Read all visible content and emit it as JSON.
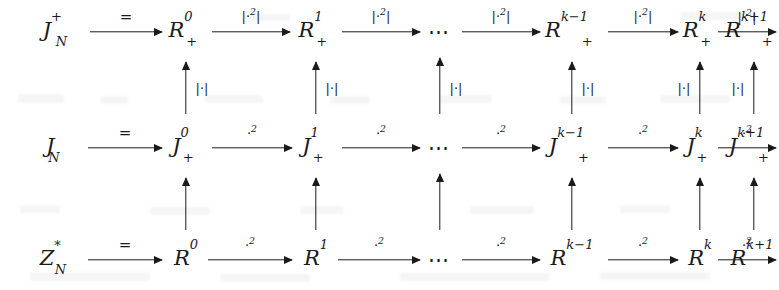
{
  "diagram": {
    "type": "commutative-diagram",
    "columns": [
      "source",
      "0",
      "1",
      "dots",
      "k-1",
      "k",
      "k+1"
    ],
    "rows": [
      {
        "id": "top",
        "nodes": [
          {
            "id": "top-source",
            "base": "J",
            "sub": "N",
            "sup": "+"
          },
          {
            "id": "top-0",
            "base": "R",
            "sub": "+",
            "sup": "0"
          },
          {
            "id": "top-1",
            "base": "R",
            "sub": "+",
            "sup": "1"
          },
          {
            "id": "top-dots",
            "base": "⋯"
          },
          {
            "id": "top-km1",
            "base": "R",
            "sub": "+",
            "sup": "k−1"
          },
          {
            "id": "top-k",
            "base": "R",
            "sub": "+",
            "sup": "k"
          },
          {
            "id": "top-kp1",
            "base": "R",
            "sub": "+",
            "sup": "k+1"
          }
        ],
        "arrow_labels": [
          "=",
          "|·²|",
          "|·²|",
          "|·²|",
          "|·²|",
          "|·²|"
        ]
      },
      {
        "id": "middle",
        "nodes": [
          {
            "id": "mid-source",
            "base": "J",
            "sub": "N",
            "sup": ""
          },
          {
            "id": "mid-0",
            "base": "J",
            "sub": "+",
            "sup": "0"
          },
          {
            "id": "mid-1",
            "base": "J",
            "sub": "+",
            "sup": "1"
          },
          {
            "id": "mid-dots",
            "base": "⋯"
          },
          {
            "id": "mid-km1",
            "base": "J",
            "sub": "+",
            "sup": "k−1"
          },
          {
            "id": "mid-k",
            "base": "J",
            "sub": "+",
            "sup": "k"
          },
          {
            "id": "mid-kp1",
            "base": "J",
            "sub": "+",
            "sup": "k+1"
          }
        ],
        "arrow_labels": [
          "=",
          "·²",
          "·²",
          "·²",
          "·²",
          "·²"
        ]
      },
      {
        "id": "bottom",
        "nodes": [
          {
            "id": "bot-source",
            "base": "Z",
            "sub": "N",
            "sup": "*"
          },
          {
            "id": "bot-0",
            "base": "R",
            "sub": "",
            "sup": "0"
          },
          {
            "id": "bot-1",
            "base": "R",
            "sub": "",
            "sup": "1"
          },
          {
            "id": "bot-dots",
            "base": "⋯"
          },
          {
            "id": "bot-km1",
            "base": "R",
            "sub": "",
            "sup": "k−1"
          },
          {
            "id": "bot-k",
            "base": "R",
            "sub": "",
            "sup": "k"
          },
          {
            "id": "bot-kp1",
            "base": "R",
            "sub": "",
            "sup": "k+1"
          }
        ],
        "arrow_labels": [
          "=",
          "·²",
          "·²",
          "·²",
          "·²",
          "·²"
        ]
      }
    ],
    "vertical_arrows": {
      "upper_label": "|·|",
      "upper_count": 6,
      "lower_label": "",
      "lower_count": 6,
      "direction": "up"
    },
    "colors": {
      "ink": "#1a1a1a",
      "background": "#ffffff"
    }
  }
}
